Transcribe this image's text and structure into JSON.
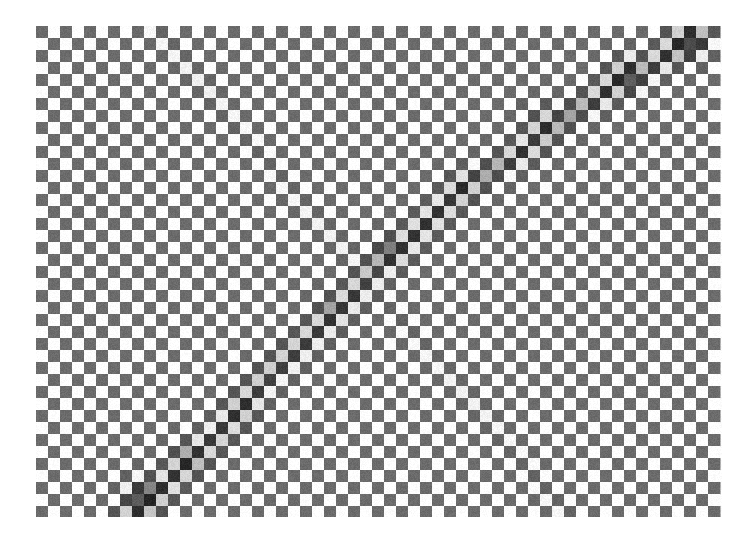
{
  "figure": {
    "background_color": "#ffffff",
    "width": 756,
    "height": 544
  },
  "plot": {
    "name": "recurrence-plot",
    "left": 36,
    "top": 26,
    "width": 686,
    "height": 491,
    "cell_size": 12.0,
    "columns": 57,
    "rows": 41
  },
  "chart_data": {
    "type": "heatmap",
    "title": "",
    "subtitle": "",
    "xlabel": "",
    "ylabel": "",
    "legend": [],
    "grid": false,
    "axis_visible": false,
    "tick_labels_x": [],
    "tick_labels_y": [],
    "xlim": [
      0,
      57
    ],
    "ylim": [
      0,
      41
    ],
    "colormap": "grayscale",
    "colors": {
      "background": "#ffffff",
      "checker_light": "#ffffff",
      "checker_dark": "#6b6b6b",
      "band_dark": "#3a3a3a",
      "band_darkest": "#242424",
      "band_light_tinted": "#b5b5b5",
      "antidiagonal_dark": "#4e4e4e"
    },
    "pattern": {
      "base": "checkerboard",
      "checker_period": 1,
      "noise_amplitude": 0.07
    },
    "features": [
      {
        "name": "main-diagonal-band",
        "orientation": "bottom-left-to-top-right",
        "intensity": 0.82,
        "half_width_cells": 1.45,
        "start": [
          0.13,
          1.0
        ],
        "end": [
          1.0,
          0.0
        ],
        "control_points": [
          [
            0.13,
            1.0
          ],
          [
            0.2,
            0.92
          ],
          [
            0.27,
            0.83
          ],
          [
            0.33,
            0.72
          ],
          [
            0.4,
            0.63
          ],
          [
            0.46,
            0.55
          ],
          [
            0.5,
            0.48
          ],
          [
            0.54,
            0.44
          ],
          [
            0.58,
            0.39
          ],
          [
            0.63,
            0.33
          ],
          [
            0.68,
            0.28
          ],
          [
            0.74,
            0.23
          ],
          [
            0.79,
            0.17
          ],
          [
            0.85,
            0.12
          ],
          [
            0.91,
            0.07
          ],
          [
            0.97,
            0.02
          ]
        ]
      },
      {
        "name": "anti-diagonal-line",
        "orientation": "top-left-to-bottom-right",
        "intensity": 0.3,
        "half_width_cells": 0.7,
        "start": [
          0.17,
          0.0
        ],
        "end": [
          0.78,
          1.0
        ]
      }
    ],
    "hotspots": [
      {
        "x": 0.16,
        "y": 0.96,
        "intensity": 1.0,
        "radius_cells": 2.4
      },
      {
        "x": 0.22,
        "y": 0.88,
        "intensity": 0.85,
        "radius_cells": 2.0
      },
      {
        "x": 0.3,
        "y": 0.78,
        "intensity": 0.72,
        "radius_cells": 1.8
      },
      {
        "x": 0.43,
        "y": 0.58,
        "intensity": 0.68,
        "radius_cells": 1.7
      },
      {
        "x": 0.52,
        "y": 0.46,
        "intensity": 0.78,
        "radius_cells": 1.9
      },
      {
        "x": 0.62,
        "y": 0.33,
        "intensity": 0.7,
        "radius_cells": 1.8
      },
      {
        "x": 0.74,
        "y": 0.2,
        "intensity": 0.8,
        "radius_cells": 2.0
      },
      {
        "x": 0.86,
        "y": 0.1,
        "intensity": 0.9,
        "radius_cells": 2.2
      },
      {
        "x": 0.95,
        "y": 0.03,
        "intensity": 0.95,
        "radius_cells": 2.3
      }
    ]
  }
}
